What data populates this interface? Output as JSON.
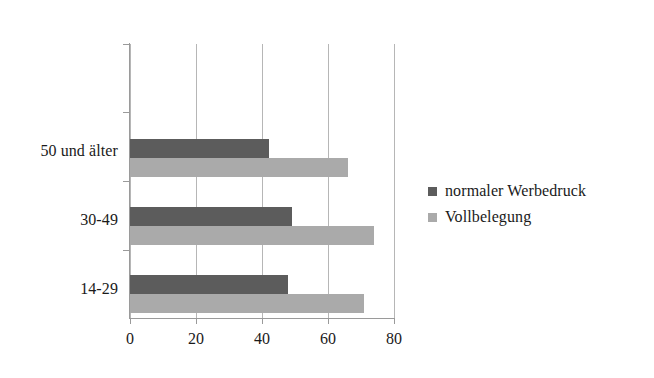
{
  "chart_data": {
    "type": "bar",
    "orientation": "horizontal",
    "title": "",
    "xlabel": "",
    "ylabel": "",
    "categories": [
      "14-29",
      "30-49",
      "50 und älter"
    ],
    "series": [
      {
        "name": "normaler Werbedruck",
        "color": "#5c5c5c",
        "values": [
          48,
          49,
          42
        ]
      },
      {
        "name": "Vollbelegung",
        "color": "#aaaaaa",
        "values": [
          71,
          74,
          66
        ]
      }
    ],
    "xlim": [
      0,
      80
    ],
    "xticks": [
      0,
      20,
      40,
      60,
      80
    ],
    "xtick_labels": [
      "0",
      "20",
      "40",
      "60",
      "80"
    ],
    "grid": "vertical",
    "legend_position": "right"
  },
  "legend": {
    "items": [
      {
        "label": "normaler Werbedruck",
        "color": "#5c5c5c"
      },
      {
        "label": "Vollbelegung",
        "color": "#aaaaaa"
      }
    ]
  },
  "axis": {
    "x_tick_labels": [
      "0",
      "20",
      "40",
      "60",
      "80"
    ],
    "y_tick_labels": [
      "50 und älter",
      "30-49",
      "14-29"
    ]
  }
}
